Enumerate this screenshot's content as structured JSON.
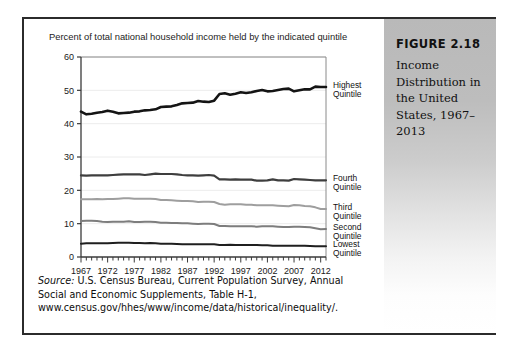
{
  "figure": {
    "caption_title": "FIGURE 2.18",
    "caption_body": "Income Distribution in the United States, 1967–2013"
  },
  "chart": {
    "subtitle": "Percent of total national household income held by the indicated quintile",
    "source_prefix": "Source:",
    "source_line1": " U.S. Census Bureau, Current Population Survey, Annual",
    "source_line2": "Social and Economic Supplements, Table H-1,",
    "source_line3": "www.census.gov/hhes/www/income/data/historical/inequality/."
  },
  "chart_data": {
    "type": "line",
    "title": "Income Distribution in the United States, 1967–2013",
    "subtitle": "Percent of total national household income held by the indicated quintile",
    "xlabel": "",
    "ylabel": "",
    "xlim": [
      1967,
      2013
    ],
    "ylim": [
      0,
      60
    ],
    "yticks": [
      0,
      10,
      20,
      30,
      40,
      50,
      60
    ],
    "xticks": [
      1967,
      1972,
      1977,
      1982,
      1987,
      1992,
      1997,
      2002,
      2007,
      2012
    ],
    "xtick_labels": [
      "1967",
      "1972",
      "1977",
      "1982",
      "1987",
      "1992",
      "1997",
      "2002",
      "2007",
      "2012"
    ],
    "ytick_labels": [
      "0",
      "10",
      "20",
      "30",
      "40",
      "50",
      "60"
    ],
    "minor_xticks_every": 1,
    "grid": true,
    "legend_position": "right-inline",
    "x": [
      1967,
      1968,
      1969,
      1970,
      1971,
      1972,
      1973,
      1974,
      1975,
      1976,
      1977,
      1978,
      1979,
      1980,
      1981,
      1982,
      1983,
      1984,
      1985,
      1986,
      1987,
      1988,
      1989,
      1990,
      1991,
      1992,
      1993,
      1994,
      1995,
      1996,
      1997,
      1998,
      1999,
      2000,
      2001,
      2002,
      2003,
      2004,
      2005,
      2006,
      2007,
      2008,
      2009,
      2010,
      2011,
      2012,
      2013
    ],
    "series": [
      {
        "name": "Highest Quintile",
        "label_line1": "Highest",
        "label_line2": "Quintile",
        "color": "#141414",
        "width": 2.6,
        "values": [
          43.6,
          42.8,
          43.0,
          43.3,
          43.5,
          43.9,
          43.6,
          43.1,
          43.2,
          43.3,
          43.6,
          43.7,
          44.0,
          44.1,
          44.3,
          45.0,
          45.1,
          45.2,
          45.6,
          46.1,
          46.2,
          46.3,
          46.8,
          46.6,
          46.5,
          46.9,
          48.9,
          49.1,
          48.7,
          49.0,
          49.4,
          49.2,
          49.4,
          49.8,
          50.1,
          49.7,
          49.8,
          50.1,
          50.4,
          50.5,
          49.7,
          50.0,
          50.3,
          50.3,
          51.1,
          51.0,
          51.0
        ]
      },
      {
        "name": "Fourth Quintile",
        "label_line1": "Fourth",
        "label_line2": "Quintile",
        "color": "#3e3e3e",
        "width": 2.2,
        "values": [
          24.5,
          24.4,
          24.5,
          24.5,
          24.5,
          24.5,
          24.6,
          24.7,
          24.8,
          24.8,
          24.8,
          24.8,
          24.6,
          24.8,
          25.0,
          24.9,
          24.9,
          24.9,
          24.8,
          24.6,
          24.5,
          24.5,
          24.4,
          24.5,
          24.6,
          24.4,
          23.3,
          23.3,
          23.2,
          23.3,
          23.2,
          23.2,
          23.2,
          22.9,
          22.9,
          23.0,
          23.3,
          23.0,
          23.0,
          22.9,
          23.4,
          23.3,
          23.2,
          23.1,
          23.0,
          23.0,
          23.0
        ]
      },
      {
        "name": "Third Quintile",
        "label_line1": "Third",
        "label_line2": "Quintile",
        "color": "#9e9e9e",
        "width": 2.0,
        "values": [
          17.3,
          17.3,
          17.3,
          17.4,
          17.3,
          17.4,
          17.4,
          17.5,
          17.6,
          17.6,
          17.5,
          17.5,
          17.5,
          17.5,
          17.4,
          17.1,
          17.1,
          17.0,
          16.9,
          16.8,
          16.8,
          16.7,
          16.5,
          16.6,
          16.6,
          16.5,
          15.9,
          15.7,
          15.8,
          15.8,
          15.8,
          15.7,
          15.7,
          15.5,
          15.5,
          15.5,
          15.5,
          15.4,
          15.3,
          15.2,
          15.6,
          15.5,
          15.3,
          15.2,
          14.9,
          14.4,
          14.4
        ]
      },
      {
        "name": "Second Quintile",
        "label_line1": "Second",
        "label_line2": "Quintile",
        "color": "#7d7d7d",
        "width": 2.0,
        "values": [
          10.8,
          10.9,
          10.9,
          10.8,
          10.6,
          10.5,
          10.6,
          10.6,
          10.6,
          10.7,
          10.5,
          10.5,
          10.6,
          10.6,
          10.5,
          10.3,
          10.3,
          10.2,
          10.2,
          10.1,
          10.1,
          10.0,
          9.9,
          10.0,
          10.0,
          9.9,
          9.3,
          9.3,
          9.2,
          9.2,
          9.2,
          9.2,
          9.2,
          9.1,
          9.2,
          9.2,
          9.2,
          9.1,
          9.0,
          9.0,
          9.1,
          9.1,
          9.0,
          8.9,
          8.6,
          8.3,
          8.4
        ]
      },
      {
        "name": "Lowest Quintile",
        "label_line1": "Lowest",
        "label_line2": "Quintile",
        "color": "#1f1f1f",
        "width": 2.0,
        "values": [
          4.0,
          4.1,
          4.1,
          4.1,
          4.1,
          4.1,
          4.2,
          4.3,
          4.3,
          4.3,
          4.2,
          4.2,
          4.1,
          4.2,
          4.1,
          4.0,
          4.0,
          4.0,
          3.9,
          3.8,
          3.8,
          3.8,
          3.8,
          3.8,
          3.8,
          3.8,
          3.6,
          3.6,
          3.7,
          3.6,
          3.6,
          3.6,
          3.6,
          3.6,
          3.5,
          3.5,
          3.4,
          3.4,
          3.4,
          3.4,
          3.4,
          3.4,
          3.4,
          3.3,
          3.2,
          3.2,
          3.2
        ]
      }
    ]
  }
}
